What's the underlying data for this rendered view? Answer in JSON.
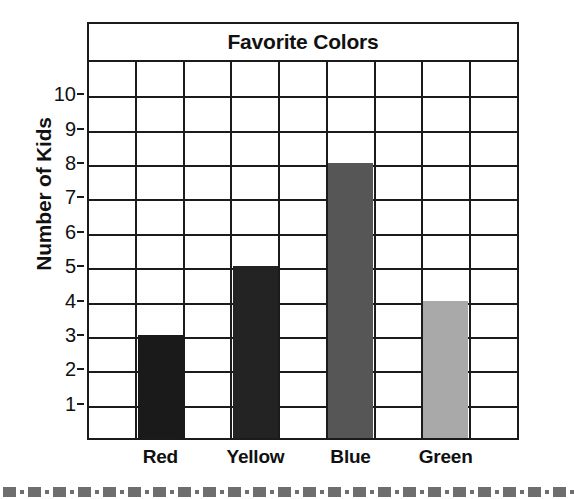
{
  "chart_data": {
    "type": "bar",
    "title": "Favorite Colors",
    "xlabel": "",
    "ylabel": "Number of Kids",
    "categories": [
      "Red",
      "Yellow",
      "Blue",
      "Green"
    ],
    "values": [
      3,
      5,
      8,
      4
    ],
    "bar_colors": [
      "#1a1a1a",
      "#232323",
      "#565656",
      "#a9a9a9"
    ],
    "ylim": [
      0,
      11
    ],
    "y_ticks": [
      1,
      2,
      3,
      4,
      5,
      6,
      7,
      8,
      9,
      10
    ],
    "y_tick_labels": [
      "1",
      "2",
      "3",
      "4",
      "5",
      "6",
      "7",
      "8",
      "9",
      "10"
    ],
    "grid": true,
    "grid_columns": 9,
    "bar_columns": [
      1,
      3,
      5,
      7
    ],
    "legend": "none",
    "axis_color": "#1b1b1b"
  },
  "worksheet": {
    "footer_decoration": "dash-dot-border",
    "footer_color": "#6e6e6e"
  }
}
